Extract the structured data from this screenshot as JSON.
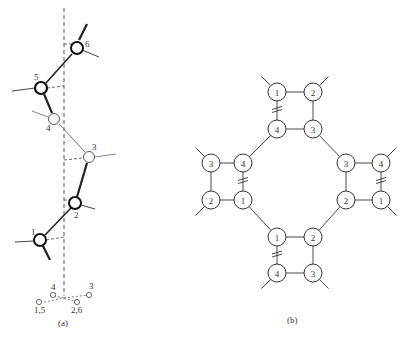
{
  "panels": {
    "a": {
      "caption": "(a)",
      "atoms": [
        {
          "id": "1",
          "label": "1",
          "bold": true
        },
        {
          "id": "2",
          "label": "2",
          "bold": true
        },
        {
          "id": "3",
          "label": "3",
          "bold": false
        },
        {
          "id": "4",
          "label": "4",
          "bold": false
        },
        {
          "id": "5",
          "label": "5",
          "bold": true
        },
        {
          "id": "6",
          "label": "6",
          "bold": true
        }
      ],
      "projection_labels": [
        "4",
        "3",
        "1,5",
        "2,6"
      ]
    },
    "b": {
      "caption": "(b)",
      "squares": [
        {
          "name": "top",
          "nodes": [
            "1",
            "2",
            "4",
            "3"
          ]
        },
        {
          "name": "left",
          "nodes": [
            "3",
            "4",
            "2",
            "1"
          ]
        },
        {
          "name": "right",
          "nodes": [
            "3",
            "4",
            "2",
            "1"
          ]
        },
        {
          "name": "bottom",
          "nodes": [
            "1",
            "2",
            "4",
            "3"
          ]
        }
      ]
    }
  }
}
